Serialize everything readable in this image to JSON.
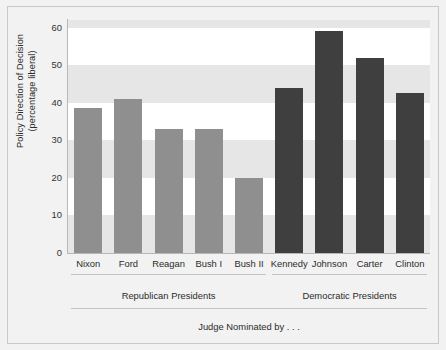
{
  "chart_data": {
    "type": "bar",
    "title": "",
    "subtitle": "",
    "xlabel": "Judge Nominated by . . .",
    "ylabel_line1": "Policy Direction of Decision",
    "ylabel_line2": "(percentage liberal)",
    "ylim": [
      0,
      62
    ],
    "yticks": [
      0,
      10,
      20,
      30,
      40,
      50,
      60
    ],
    "ytick_labels": [
      "0",
      "10",
      "20",
      "30",
      "40",
      "50",
      "60"
    ],
    "grid": "horizontal-bands",
    "legend": "none",
    "categories": [
      "Nixon",
      "Ford",
      "Reagan",
      "Bush I",
      "Bush II",
      "Kennedy",
      "Johnson",
      "Carter",
      "Clinton"
    ],
    "values": [
      38.5,
      41,
      33,
      33,
      20,
      44,
      59,
      52,
      42.5
    ],
    "groups": [
      {
        "label": "Republican Presidents",
        "members": [
          "Nixon",
          "Ford",
          "Reagan",
          "Bush I",
          "Bush II"
        ],
        "color": "#8f8f8f"
      },
      {
        "label": "Democratic Presidents",
        "members": [
          "Kennedy",
          "Johnson",
          "Carter",
          "Clinton"
        ],
        "color": "#3f3f3f"
      }
    ],
    "bars": [
      {
        "category": "Nixon",
        "value": 38.5,
        "group": "Republican Presidents",
        "color": "#8f8f8f"
      },
      {
        "category": "Ford",
        "value": 41,
        "group": "Republican Presidents",
        "color": "#8f8f8f"
      },
      {
        "category": "Reagan",
        "value": 33,
        "group": "Republican Presidents",
        "color": "#8f8f8f"
      },
      {
        "category": "Bush I",
        "value": 33,
        "group": "Republican Presidents",
        "color": "#8f8f8f"
      },
      {
        "category": "Bush II",
        "value": 20,
        "group": "Republican Presidents",
        "color": "#8f8f8f"
      },
      {
        "category": "Kennedy",
        "value": 44,
        "group": "Democratic Presidents",
        "color": "#3f3f3f"
      },
      {
        "category": "Johnson",
        "value": 59,
        "group": "Democratic Presidents",
        "color": "#3f3f3f"
      },
      {
        "category": "Carter",
        "value": 52,
        "group": "Democratic Presidents",
        "color": "#3f3f3f"
      },
      {
        "category": "Clinton",
        "value": 42.5,
        "group": "Democratic Presidents",
        "color": "#3f3f3f"
      }
    ],
    "colors": {
      "republican_bar": "#8f8f8f",
      "democratic_bar": "#3f3f3f",
      "plot_background": "#ffffff",
      "band_shade": "#e6e6e6",
      "figure_background": "#f2f2f2",
      "frame_border": "#c9c9c9",
      "axis_line": "#b7b7b7",
      "text": "#2b2b2b"
    }
  }
}
